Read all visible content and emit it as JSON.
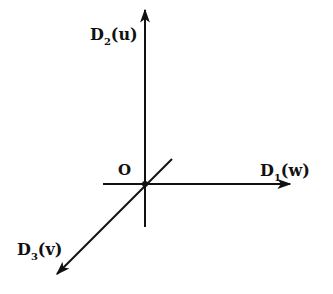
{
  "diagram": {
    "type": "3d-coordinate-axes",
    "origin": {
      "label": "O",
      "x": 145,
      "y": 184
    },
    "axes": [
      {
        "id": "D1",
        "label_main": "D",
        "label_sub": "1",
        "label_var": "(w)",
        "direction": "right",
        "from": [
          103,
          184
        ],
        "to": [
          290,
          184
        ]
      },
      {
        "id": "D2",
        "label_main": "D",
        "label_sub": "2",
        "label_var": "(u)",
        "direction": "up",
        "from": [
          145,
          227
        ],
        "to": [
          145,
          10
        ]
      },
      {
        "id": "D3",
        "label_main": "D",
        "label_sub": "3",
        "label_var": "(v)",
        "direction": "down-left",
        "from": [
          172,
          159
        ],
        "to": [
          57,
          274
        ]
      }
    ],
    "colors": {
      "line": "#111111",
      "background": "#ffffff"
    }
  }
}
